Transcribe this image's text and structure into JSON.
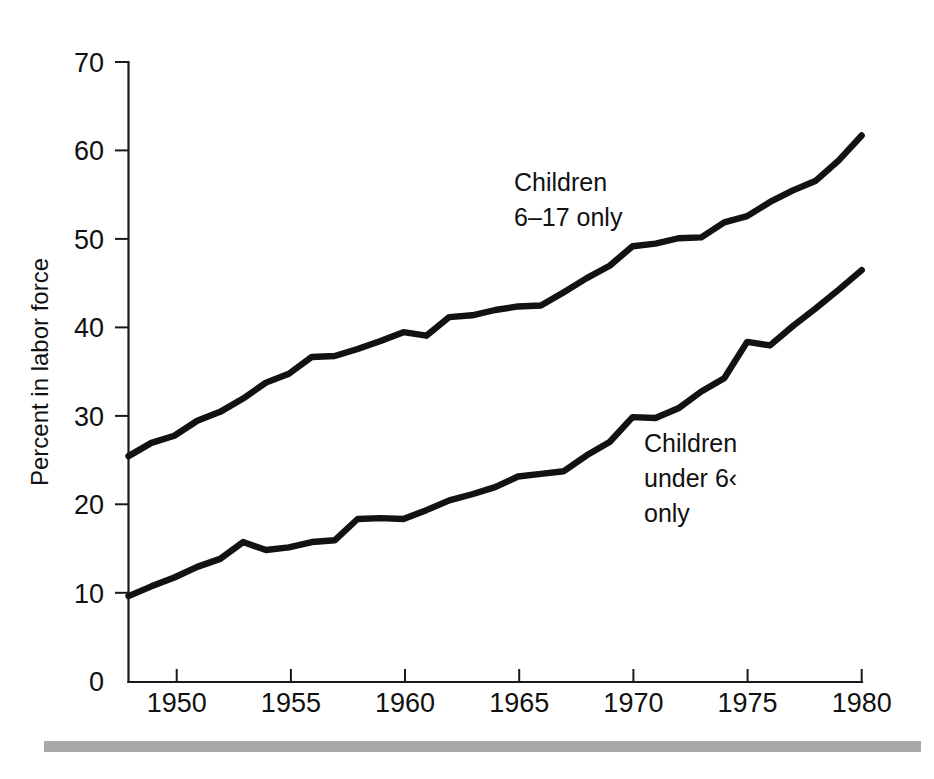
{
  "figure": {
    "background_color": "#ffffff",
    "line_color": "#121212",
    "axis_color": "#1a1a1a",
    "footer_rule_color": "#a8a8a8"
  },
  "chart_data": {
    "type": "line",
    "title": "",
    "subtitle": "",
    "xlabel": "",
    "ylabel": "Percent in labor force",
    "xlim": [
      1948,
      1980
    ],
    "ylim": [
      0,
      70
    ],
    "grid": false,
    "legend_position": "inline-annotation",
    "x_ticks": [
      1950,
      1955,
      1960,
      1965,
      1970,
      1975,
      1980
    ],
    "x_tick_labels": [
      "1950",
      "1955",
      "1960",
      "1965",
      "1970",
      "1975",
      "1980"
    ],
    "y_ticks": [
      0,
      10,
      20,
      30,
      40,
      50,
      60,
      70
    ],
    "y_tick_labels": [
      "0",
      "10",
      "20",
      "30",
      "40",
      "50",
      "60",
      "70"
    ],
    "x": [
      1948,
      1949,
      1950,
      1951,
      1952,
      1953,
      1954,
      1955,
      1956,
      1957,
      1958,
      1959,
      1960,
      1961,
      1962,
      1963,
      1964,
      1965,
      1966,
      1967,
      1968,
      1969,
      1970,
      1971,
      1972,
      1973,
      1974,
      1975,
      1976,
      1977,
      1978,
      1979,
      1980
    ],
    "series": [
      {
        "name": "Children 6-17 only",
        "label_lines": [
          "Children",
          "6–17 only"
        ],
        "values": [
          25.5,
          27.0,
          27.8,
          29.5,
          30.5,
          32.0,
          33.8,
          34.8,
          36.7,
          36.8,
          37.6,
          38.5,
          39.5,
          39.1,
          41.2,
          41.4,
          42.0,
          42.4,
          42.5,
          44.0,
          45.6,
          47.0,
          49.2,
          49.5,
          50.1,
          50.2,
          51.9,
          52.6,
          54.2,
          55.5,
          56.6,
          58.9,
          61.7
        ],
        "annotation": {
          "x": 1964.0,
          "y": 53.0
        }
      },
      {
        "name": "Children under 6 only",
        "label_lines": [
          "Children",
          "under 6",
          "only"
        ],
        "values": [
          9.7,
          10.8,
          11.8,
          13.0,
          13.9,
          15.8,
          14.9,
          15.2,
          15.8,
          16.0,
          18.4,
          18.5,
          18.4,
          19.4,
          20.5,
          21.2,
          22.0,
          23.2,
          23.5,
          23.8,
          25.6,
          27.1,
          29.9,
          29.8,
          30.9,
          32.8,
          34.3,
          38.4,
          38.0,
          40.2,
          42.2,
          44.3,
          46.5
        ],
        "annotation": {
          "x": 1969.5,
          "y": 27.5
        }
      }
    ]
  },
  "annotations": {
    "upper": {
      "line1": "Children",
      "line2": "6–17 only"
    },
    "lower": {
      "line1": "Children",
      "line2": "under 6‹",
      "line3": "only"
    }
  }
}
